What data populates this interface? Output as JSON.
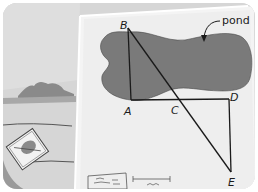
{
  "figure": {
    "annotation": {
      "text": "pond",
      "arrow": "curved-arrow-pointing-to-pond"
    },
    "points": [
      {
        "label": "B",
        "x": 128,
        "y": 28
      },
      {
        "label": "A",
        "x": 131,
        "y": 100
      },
      {
        "label": "C",
        "x": 178,
        "y": 100
      },
      {
        "label": "D",
        "x": 229,
        "y": 99
      },
      {
        "label": "E",
        "x": 231,
        "y": 170
      }
    ],
    "segments": [
      "AB",
      "AD",
      "DE",
      "BE"
    ],
    "intersection": "C lies on AD and BE",
    "colors": {
      "pond": "#7a7a7a",
      "paper": "#eeeeee",
      "background": "#d4d4d4",
      "lines": "#1a1a1a"
    }
  },
  "labels": {
    "pond": "pond",
    "B": "B",
    "A": "A",
    "C": "C",
    "D": "D",
    "E": "E"
  }
}
